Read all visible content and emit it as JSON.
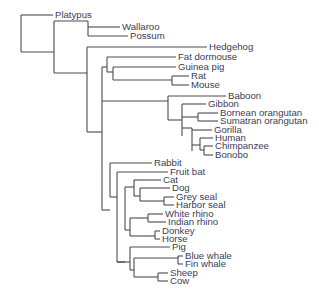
{
  "diagram": {
    "type": "phylogenetic-tree",
    "style": {
      "line_color": "#4a4a55",
      "text_color": "#3c3c58",
      "background": "#ffffff"
    },
    "leaves": [
      {
        "id": "platypus",
        "label": "Platypus",
        "x": 53,
        "y": 15
      },
      {
        "id": "wallaroo",
        "label": "Wallaroo",
        "x": 120,
        "y": 27
      },
      {
        "id": "possum",
        "label": "Possum",
        "x": 128,
        "y": 36
      },
      {
        "id": "hedgehog",
        "label": "Hedgehog",
        "x": 207,
        "y": 47
      },
      {
        "id": "fat-dormouse",
        "label": "Fat dormouse",
        "x": 176,
        "y": 57
      },
      {
        "id": "guinea-pig",
        "label": "Guinea pig",
        "x": 176,
        "y": 67
      },
      {
        "id": "rat",
        "label": "Rat",
        "x": 189,
        "y": 76
      },
      {
        "id": "mouse",
        "label": "Mouse",
        "x": 189,
        "y": 85
      },
      {
        "id": "baboon",
        "label": "Baboon",
        "x": 226,
        "y": 96
      },
      {
        "id": "gibbon",
        "label": "Gibbon",
        "x": 206,
        "y": 104
      },
      {
        "id": "bornean-orangutan",
        "label": "Bornean orangutan",
        "x": 218,
        "y": 113
      },
      {
        "id": "sumatran-orangutan",
        "label": "Sumatran orangutan",
        "x": 218,
        "y": 121
      },
      {
        "id": "gorilla",
        "label": "Gorilla",
        "x": 212,
        "y": 130
      },
      {
        "id": "human",
        "label": "Human",
        "x": 213,
        "y": 138
      },
      {
        "id": "chimpanzee",
        "label": "Chimpanzee",
        "x": 213,
        "y": 146
      },
      {
        "id": "bonobo",
        "label": "Bonobo",
        "x": 213,
        "y": 155
      },
      {
        "id": "rabbit",
        "label": "Rabbit",
        "x": 152,
        "y": 163
      },
      {
        "id": "fruit-bat",
        "label": "Fruit bat",
        "x": 168,
        "y": 172
      },
      {
        "id": "cat",
        "label": "Cat",
        "x": 161,
        "y": 180
      },
      {
        "id": "dog",
        "label": "Dog",
        "x": 170,
        "y": 188
      },
      {
        "id": "grey-seal",
        "label": "Grey seal",
        "x": 174,
        "y": 197
      },
      {
        "id": "harbor-seal",
        "label": "Harbor seal",
        "x": 174,
        "y": 205
      },
      {
        "id": "white-rhino",
        "label": "White rhino",
        "x": 163,
        "y": 214
      },
      {
        "id": "indian-rhino",
        "label": "Indian rhino",
        "x": 166,
        "y": 222
      },
      {
        "id": "donkey",
        "label": "Donkey",
        "x": 160,
        "y": 231
      },
      {
        "id": "horse",
        "label": "Horse",
        "x": 160,
        "y": 239
      },
      {
        "id": "pig",
        "label": "Pig",
        "x": 170,
        "y": 247
      },
      {
        "id": "blue-whale",
        "label": "Blue whale",
        "x": 183,
        "y": 256
      },
      {
        "id": "fin-whale",
        "label": "Fin whale",
        "x": 183,
        "y": 264
      },
      {
        "id": "sheep",
        "label": "Sheep",
        "x": 168,
        "y": 273
      },
      {
        "id": "cow",
        "label": "Cow",
        "x": 168,
        "y": 281
      }
    ],
    "branches": [
      [
        21,
        15,
        21,
        52
      ],
      [
        21,
        15,
        53,
        15
      ],
      [
        21,
        52,
        54,
        52
      ],
      [
        54,
        21,
        54,
        73
      ],
      [
        54,
        21,
        88,
        21
      ],
      [
        88,
        21,
        88,
        36
      ],
      [
        88,
        27,
        120,
        27
      ],
      [
        88,
        36,
        128,
        36
      ],
      [
        54,
        73,
        87,
        73
      ],
      [
        87,
        47,
        87,
        132
      ],
      [
        87,
        47,
        207,
        47
      ],
      [
        87,
        132,
        102,
        132
      ],
      [
        102,
        67,
        102,
        210
      ],
      [
        102,
        67,
        107,
        67
      ],
      [
        107,
        57,
        107,
        72
      ],
      [
        107,
        57,
        176,
        57
      ],
      [
        107,
        72,
        113,
        72
      ],
      [
        113,
        67,
        113,
        80
      ],
      [
        113,
        67,
        176,
        67
      ],
      [
        113,
        80,
        172,
        80
      ],
      [
        172,
        76,
        172,
        85
      ],
      [
        172,
        76,
        189,
        76
      ],
      [
        172,
        85,
        189,
        85
      ],
      [
        102,
        101,
        168,
        101
      ],
      [
        168,
        96,
        168,
        120
      ],
      [
        168,
        96,
        226,
        96
      ],
      [
        168,
        120,
        182,
        120
      ],
      [
        182,
        104,
        182,
        136
      ],
      [
        182,
        104,
        206,
        104
      ],
      [
        182,
        128,
        192,
        128
      ],
      [
        182,
        117,
        198,
        117
      ],
      [
        198,
        113,
        198,
        121
      ],
      [
        198,
        113,
        218,
        113
      ],
      [
        198,
        121,
        218,
        121
      ],
      [
        192,
        128,
        192,
        151
      ],
      [
        192,
        130,
        212,
        130
      ],
      [
        192,
        145,
        200,
        145
      ],
      [
        200,
        138,
        200,
        150
      ],
      [
        200,
        138,
        213,
        138
      ],
      [
        200,
        150,
        204,
        150
      ],
      [
        204,
        146,
        204,
        155
      ],
      [
        204,
        146,
        213,
        146
      ],
      [
        204,
        155,
        213,
        155
      ],
      [
        102,
        210,
        110,
        210
      ],
      [
        110,
        163,
        110,
        197
      ],
      [
        110,
        163,
        152,
        163
      ],
      [
        110,
        197,
        117,
        197
      ],
      [
        117,
        172,
        117,
        262
      ],
      [
        117,
        172,
        168,
        172
      ],
      [
        117,
        262,
        125,
        262
      ],
      [
        125,
        187,
        125,
        230
      ],
      [
        125,
        187,
        134,
        187
      ],
      [
        134,
        180,
        134,
        196
      ],
      [
        134,
        180,
        161,
        180
      ],
      [
        134,
        196,
        140,
        196
      ],
      [
        140,
        188,
        140,
        201
      ],
      [
        140,
        188,
        170,
        188
      ],
      [
        140,
        201,
        164,
        201
      ],
      [
        164,
        197,
        164,
        205
      ],
      [
        164,
        197,
        174,
        197
      ],
      [
        164,
        205,
        174,
        205
      ],
      [
        125,
        230,
        130,
        230
      ],
      [
        130,
        218,
        130,
        236
      ],
      [
        130,
        218,
        148,
        218
      ],
      [
        148,
        214,
        148,
        222
      ],
      [
        148,
        214,
        163,
        214
      ],
      [
        148,
        222,
        166,
        222
      ],
      [
        130,
        236,
        155,
        236
      ],
      [
        155,
        231,
        155,
        239
      ],
      [
        155,
        231,
        160,
        231
      ],
      [
        155,
        239,
        160,
        239
      ],
      [
        117,
        262,
        130,
        262
      ],
      [
        130,
        247,
        130,
        270
      ],
      [
        130,
        247,
        170,
        247
      ],
      [
        130,
        270,
        134,
        270
      ],
      [
        134,
        258,
        134,
        277
      ],
      [
        134,
        258,
        178,
        258
      ],
      [
        178,
        256,
        178,
        264
      ],
      [
        178,
        256,
        183,
        256
      ],
      [
        178,
        264,
        183,
        264
      ],
      [
        134,
        277,
        158,
        277
      ],
      [
        158,
        273,
        158,
        281
      ],
      [
        158,
        273,
        168,
        273
      ],
      [
        158,
        281,
        168,
        281
      ]
    ]
  }
}
